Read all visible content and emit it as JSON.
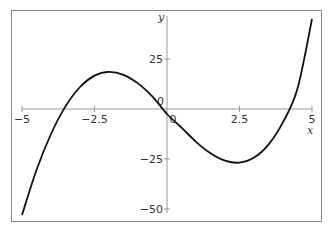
{
  "chart_data": {
    "type": "line",
    "title": "",
    "xlabel": "x",
    "ylabel": "y",
    "xlim": [
      -5,
      5
    ],
    "ylim": [
      -52,
      47
    ],
    "xticks": [
      -5,
      -2.5,
      0,
      2.5,
      5
    ],
    "xtick_labels": [
      "−5",
      "−2.5",
      "0",
      "2.5",
      "5"
    ],
    "yticks": [
      25,
      0,
      -25,
      -50
    ],
    "ytick_labels": [
      "25",
      "0",
      "−25",
      "−50"
    ],
    "grid": false,
    "series": [
      {
        "name": "f(x)",
        "x": [
          -5,
          -4.5,
          -4,
          -3.5,
          -3,
          -2.5,
          -2,
          -1.5,
          -1,
          -0.5,
          0,
          0.5,
          1,
          1.5,
          2,
          2.5,
          3,
          3.5,
          4,
          4.5,
          5
        ],
        "y": [
          -53,
          -30.5,
          -12.5,
          1.3,
          11,
          16.7,
          18.6,
          17.1,
          12.8,
          6.2,
          -2.5,
          -9.3,
          -16.4,
          -22.1,
          -25.8,
          -26.8,
          -24.3,
          -17.8,
          -6.6,
          10.2,
          45
        ]
      }
    ]
  }
}
